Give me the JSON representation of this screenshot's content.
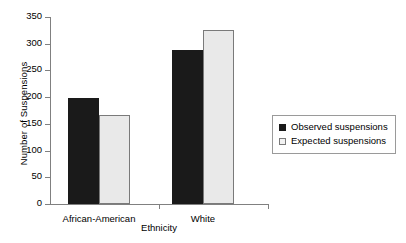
{
  "chart_data": {
    "type": "bar",
    "title": "",
    "xlabel": "Ethnicity",
    "ylabel": "Number of Suspensions",
    "categories": [
      "African-American",
      "White"
    ],
    "series": [
      {
        "name": "Observed suspensions",
        "values": [
          199,
          288
        ],
        "color": "#1a1a1a"
      },
      {
        "name": "Expected suspensions",
        "values": [
          167,
          326
        ],
        "color": "#e9e9e9"
      }
    ],
    "ylim": [
      0,
      350
    ],
    "yticks": [
      0,
      50,
      100,
      150,
      200,
      250,
      300,
      350
    ],
    "ytick_labels": [
      "0",
      "50",
      "100",
      "150",
      "200",
      "250",
      "300",
      "350"
    ],
    "grid": false,
    "legend_position": "right"
  },
  "legend": {
    "items": [
      {
        "label": "Observed suspensions",
        "swatch": "filled-square-icon"
      },
      {
        "label": "Expected suspensions",
        "swatch": "outlined-square-icon"
      }
    ]
  }
}
